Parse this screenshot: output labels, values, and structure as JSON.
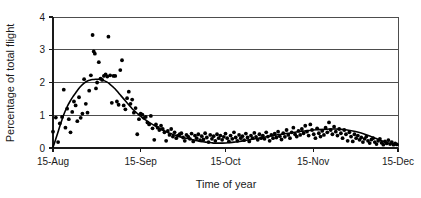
{
  "chart_data": {
    "type": "scatter",
    "title": "",
    "subtitle": "",
    "xlabel": "Time of year",
    "ylabel": "Percentage of total flight",
    "xlim": [
      0,
      122
    ],
    "ylim": [
      0,
      4
    ],
    "grid": true,
    "legend": "none",
    "y_ticks": [
      "0",
      "1",
      "2",
      "3",
      "4"
    ],
    "y_tick_values": [
      0,
      1,
      2,
      3,
      4
    ],
    "x_ticks": [
      "15-Aug",
      "15-Sep",
      "15-Oct",
      "15-Nov",
      "15-Dec"
    ],
    "x_tick_values": [
      0,
      31,
      61,
      92,
      122
    ],
    "series": [
      {
        "name": "Daily percentage of total flight",
        "type": "scatter",
        "marker": "filled-circle",
        "color": "#000000",
        "points": [
          [
            0.0,
            0.5
          ],
          [
            1.0,
            0.93
          ],
          [
            1.8,
            0.18
          ],
          [
            2.4,
            0.75
          ],
          [
            3.2,
            0.95
          ],
          [
            3.8,
            1.78
          ],
          [
            4.4,
            0.62
          ],
          [
            5.0,
            1.2
          ],
          [
            5.6,
            0.88
          ],
          [
            6.2,
            0.48
          ],
          [
            6.8,
            1.1
          ],
          [
            7.4,
            1.42
          ],
          [
            8.0,
            1.3
          ],
          [
            8.6,
            0.82
          ],
          [
            9.2,
            1.55
          ],
          [
            9.8,
            0.92
          ],
          [
            10.4,
            1.05
          ],
          [
            11.0,
            2.1
          ],
          [
            11.6,
            1.35
          ],
          [
            12.2,
            1.08
          ],
          [
            12.8,
            1.75
          ],
          [
            13.4,
            2.22
          ],
          [
            14.0,
            3.45
          ],
          [
            14.4,
            2.95
          ],
          [
            14.8,
            2.88
          ],
          [
            15.2,
            1.82
          ],
          [
            15.6,
            2.0
          ],
          [
            16.2,
            2.62
          ],
          [
            16.8,
            2.12
          ],
          [
            17.4,
            2.08
          ],
          [
            18.0,
            2.2
          ],
          [
            18.6,
            2.25
          ],
          [
            19.2,
            2.18
          ],
          [
            19.6,
            3.4
          ],
          [
            20.2,
            2.22
          ],
          [
            20.8,
            1.38
          ],
          [
            21.4,
            2.2
          ],
          [
            22.0,
            2.2
          ],
          [
            22.6,
            1.42
          ],
          [
            23.2,
            1.32
          ],
          [
            23.8,
            2.38
          ],
          [
            24.4,
            2.68
          ],
          [
            25.0,
            1.3
          ],
          [
            25.6,
            1.18
          ],
          [
            26.2,
            1.52
          ],
          [
            26.8,
            1.72
          ],
          [
            27.4,
            1.35
          ],
          [
            28.0,
            1.48
          ],
          [
            28.6,
            1.08
          ],
          [
            29.2,
            1.22
          ],
          [
            29.8,
            0.42
          ],
          [
            30.4,
            0.88
          ],
          [
            31.0,
            1.05
          ],
          [
            31.6,
            1.02
          ],
          [
            32.2,
            0.92
          ],
          [
            32.8,
            0.95
          ],
          [
            33.4,
            0.78
          ],
          [
            34.0,
            0.72
          ],
          [
            34.6,
            0.98
          ],
          [
            35.2,
            0.6
          ],
          [
            35.8,
            0.25
          ],
          [
            36.4,
            0.72
          ],
          [
            37.0,
            0.62
          ],
          [
            37.6,
            0.55
          ],
          [
            38.2,
            0.68
          ],
          [
            38.8,
            0.58
          ],
          [
            39.4,
            0.48
          ],
          [
            40.0,
            0.22
          ],
          [
            40.6,
            0.52
          ],
          [
            41.2,
            0.4
          ],
          [
            41.8,
            0.58
          ],
          [
            42.4,
            0.35
          ],
          [
            43.0,
            0.48
          ],
          [
            43.6,
            0.3
          ],
          [
            44.2,
            0.38
          ],
          [
            44.8,
            0.42
          ],
          [
            45.4,
            0.45
          ],
          [
            46.0,
            0.32
          ],
          [
            46.6,
            0.22
          ],
          [
            47.2,
            0.4
          ],
          [
            47.8,
            0.35
          ],
          [
            48.4,
            0.28
          ],
          [
            49.0,
            0.44
          ],
          [
            49.6,
            0.2
          ],
          [
            50.2,
            0.38
          ],
          [
            50.8,
            0.3
          ],
          [
            51.4,
            0.42
          ],
          [
            52.0,
            0.24
          ],
          [
            52.6,
            0.36
          ],
          [
            53.2,
            0.26
          ],
          [
            53.8,
            0.45
          ],
          [
            54.4,
            0.32
          ],
          [
            55.0,
            0.18
          ],
          [
            55.6,
            0.4
          ],
          [
            56.2,
            0.28
          ],
          [
            56.8,
            0.36
          ],
          [
            57.4,
            0.22
          ],
          [
            58.0,
            0.42
          ],
          [
            58.6,
            0.3
          ],
          [
            59.2,
            0.38
          ],
          [
            59.8,
            0.25
          ],
          [
            60.4,
            0.34
          ],
          [
            61.0,
            0.44
          ],
          [
            61.6,
            0.3
          ],
          [
            62.2,
            0.2
          ],
          [
            62.8,
            0.38
          ],
          [
            63.4,
            0.28
          ],
          [
            64.0,
            0.48
          ],
          [
            64.6,
            0.32
          ],
          [
            65.2,
            0.22
          ],
          [
            65.8,
            0.4
          ],
          [
            66.4,
            0.3
          ],
          [
            67.0,
            0.36
          ],
          [
            67.6,
            0.24
          ],
          [
            68.2,
            0.44
          ],
          [
            68.8,
            0.32
          ],
          [
            69.4,
            0.2
          ],
          [
            70.0,
            0.38
          ],
          [
            70.6,
            0.3
          ],
          [
            71.2,
            0.46
          ],
          [
            71.8,
            0.34
          ],
          [
            72.4,
            0.25
          ],
          [
            73.0,
            0.42
          ],
          [
            73.6,
            0.3
          ],
          [
            74.2,
            0.38
          ],
          [
            74.8,
            0.28
          ],
          [
            75.4,
            0.48
          ],
          [
            76.0,
            0.35
          ],
          [
            76.6,
            0.22
          ],
          [
            77.2,
            0.4
          ],
          [
            77.8,
            0.3
          ],
          [
            78.4,
            0.44
          ],
          [
            79.0,
            0.32
          ],
          [
            79.6,
            0.5
          ],
          [
            80.2,
            0.36
          ],
          [
            80.8,
            0.26
          ],
          [
            81.4,
            0.45
          ],
          [
            82.0,
            0.34
          ],
          [
            82.6,
            0.55
          ],
          [
            83.2,
            0.4
          ],
          [
            83.8,
            0.3
          ],
          [
            84.4,
            0.48
          ],
          [
            85.0,
            0.62
          ],
          [
            85.6,
            0.42
          ],
          [
            86.2,
            0.35
          ],
          [
            86.8,
            0.52
          ],
          [
            87.4,
            0.4
          ],
          [
            88.0,
            0.58
          ],
          [
            88.6,
            0.45
          ],
          [
            89.2,
            0.68
          ],
          [
            89.8,
            0.5
          ],
          [
            90.4,
            0.38
          ],
          [
            91.0,
            0.72
          ],
          [
            91.6,
            0.55
          ],
          [
            92.2,
            0.42
          ],
          [
            92.8,
            0.3
          ],
          [
            93.4,
            0.6
          ],
          [
            94.0,
            0.45
          ],
          [
            94.6,
            0.35
          ],
          [
            95.2,
            0.52
          ],
          [
            95.8,
            0.4
          ],
          [
            96.4,
            0.62
          ],
          [
            97.0,
            0.48
          ],
          [
            97.6,
            0.78
          ],
          [
            98.2,
            0.55
          ],
          [
            98.8,
            0.42
          ],
          [
            99.4,
            0.65
          ],
          [
            100.0,
            0.5
          ],
          [
            100.6,
            0.38
          ],
          [
            101.2,
            0.58
          ],
          [
            101.8,
            0.45
          ],
          [
            102.4,
            0.3
          ],
          [
            103.0,
            0.55
          ],
          [
            103.6,
            0.42
          ],
          [
            104.2,
            0.22
          ],
          [
            104.8,
            0.48
          ],
          [
            105.4,
            0.35
          ],
          [
            106.0,
            0.2
          ],
          [
            106.6,
            0.42
          ],
          [
            107.2,
            0.3
          ],
          [
            107.8,
            0.38
          ],
          [
            108.4,
            0.25
          ],
          [
            109.0,
            0.32
          ],
          [
            109.6,
            0.18
          ],
          [
            110.2,
            0.28
          ],
          [
            110.8,
            0.35
          ],
          [
            111.4,
            0.22
          ],
          [
            112.0,
            0.15
          ],
          [
            112.6,
            0.26
          ],
          [
            113.2,
            0.3
          ],
          [
            113.8,
            0.18
          ],
          [
            114.4,
            0.12
          ],
          [
            115.0,
            0.22
          ],
          [
            115.6,
            0.28
          ],
          [
            116.2,
            0.16
          ],
          [
            116.8,
            0.1
          ],
          [
            117.4,
            0.2
          ],
          [
            118.0,
            0.14
          ],
          [
            118.6,
            0.24
          ],
          [
            119.2,
            0.12
          ],
          [
            119.8,
            0.18
          ],
          [
            120.4,
            0.1
          ],
          [
            121.0,
            0.14
          ],
          [
            121.6,
            0.11
          ]
        ]
      },
      {
        "name": "Fitted trend curve",
        "type": "line",
        "color": "#000000",
        "points": [
          [
            0.0,
            0.02
          ],
          [
            1.0,
            0.28
          ],
          [
            2.0,
            0.55
          ],
          [
            3.0,
            0.82
          ],
          [
            4.0,
            1.06
          ],
          [
            5.0,
            1.26
          ],
          [
            6.0,
            1.42
          ],
          [
            7.0,
            1.56
          ],
          [
            8.0,
            1.68
          ],
          [
            9.0,
            1.8
          ],
          [
            10.0,
            1.9
          ],
          [
            11.0,
            1.98
          ],
          [
            12.0,
            2.04
          ],
          [
            13.0,
            2.07
          ],
          [
            14.0,
            2.09
          ],
          [
            15.0,
            2.1
          ],
          [
            16.0,
            2.1
          ],
          [
            17.0,
            2.09
          ],
          [
            18.0,
            2.06
          ],
          [
            19.0,
            2.02
          ],
          [
            20.0,
            1.96
          ],
          [
            21.0,
            1.88
          ],
          [
            22.0,
            1.8
          ],
          [
            23.0,
            1.7
          ],
          [
            24.0,
            1.6
          ],
          [
            25.0,
            1.5
          ],
          [
            26.0,
            1.4
          ],
          [
            27.0,
            1.3
          ],
          [
            28.0,
            1.2
          ],
          [
            29.0,
            1.12
          ],
          [
            30.0,
            1.04
          ],
          [
            31.0,
            0.97
          ],
          [
            32.0,
            0.9
          ],
          [
            33.0,
            0.84
          ],
          [
            34.0,
            0.78
          ],
          [
            35.0,
            0.73
          ],
          [
            36.0,
            0.68
          ],
          [
            37.0,
            0.63
          ],
          [
            38.0,
            0.58
          ],
          [
            39.0,
            0.54
          ],
          [
            40.0,
            0.5
          ],
          [
            41.0,
            0.46
          ],
          [
            42.0,
            0.43
          ],
          [
            43.0,
            0.4
          ],
          [
            44.0,
            0.37
          ],
          [
            45.0,
            0.34
          ],
          [
            46.0,
            0.32
          ],
          [
            47.0,
            0.3
          ],
          [
            48.0,
            0.28
          ],
          [
            49.0,
            0.26
          ],
          [
            50.0,
            0.24
          ],
          [
            51.0,
            0.22
          ],
          [
            52.0,
            0.2
          ],
          [
            53.0,
            0.19
          ],
          [
            54.0,
            0.18
          ],
          [
            55.0,
            0.17
          ],
          [
            56.0,
            0.16
          ],
          [
            57.0,
            0.15
          ],
          [
            58.0,
            0.15
          ],
          [
            59.0,
            0.15
          ],
          [
            60.0,
            0.15
          ],
          [
            62.0,
            0.16
          ],
          [
            64.0,
            0.18
          ],
          [
            66.0,
            0.2
          ],
          [
            68.0,
            0.23
          ],
          [
            70.0,
            0.26
          ],
          [
            72.0,
            0.29
          ],
          [
            74.0,
            0.32
          ],
          [
            76.0,
            0.35
          ],
          [
            78.0,
            0.38
          ],
          [
            80.0,
            0.41
          ],
          [
            82.0,
            0.44
          ],
          [
            84.0,
            0.46
          ],
          [
            86.0,
            0.49
          ],
          [
            88.0,
            0.51
          ],
          [
            90.0,
            0.53
          ],
          [
            92.0,
            0.55
          ],
          [
            94.0,
            0.56
          ],
          [
            96.0,
            0.57
          ],
          [
            98.0,
            0.58
          ],
          [
            100.0,
            0.58
          ],
          [
            102.0,
            0.57
          ],
          [
            104.0,
            0.55
          ],
          [
            106.0,
            0.52
          ],
          [
            108.0,
            0.48
          ],
          [
            110.0,
            0.43
          ],
          [
            112.0,
            0.37
          ],
          [
            114.0,
            0.3
          ],
          [
            116.0,
            0.23
          ],
          [
            118.0,
            0.17
          ],
          [
            120.0,
            0.12
          ],
          [
            122.0,
            0.09
          ]
        ]
      }
    ]
  }
}
